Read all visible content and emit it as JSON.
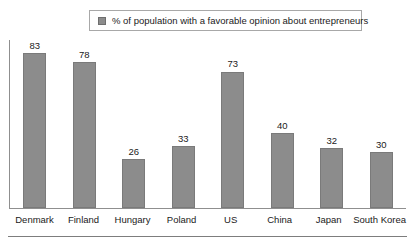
{
  "legend": {
    "swatch_icon": "legend-swatch-icon",
    "label": "% of population with a favorable opinion about entrepreneurs",
    "position": "top-center"
  },
  "colors": {
    "bar_fill": "#8c8c8c",
    "bar_border": "#7a7a7a",
    "axis": "#8f8f8f",
    "text": "#1a1a1a",
    "background": "#ffffff",
    "legend_border": "#a8a8a8"
  },
  "chart_data": {
    "type": "bar",
    "title": "",
    "subtitle": "",
    "xlabel": "",
    "ylabel": "",
    "ylim": [
      0,
      90
    ],
    "grid": false,
    "legend_position": "top-center",
    "categories": [
      "Denmark",
      "Finland",
      "Hungary",
      "Poland",
      "US",
      "China",
      "Japan",
      "South Korea"
    ],
    "values": [
      83,
      78,
      26,
      33,
      73,
      40,
      32,
      30
    ],
    "series": [
      {
        "name": "% of population with a favorable opinion about entrepreneurs",
        "values": [
          83,
          78,
          26,
          33,
          73,
          40,
          32,
          30
        ]
      }
    ],
    "bars": [
      {
        "category": "Denmark",
        "value": 83,
        "label": "83"
      },
      {
        "category": "Finland",
        "value": 78,
        "label": "78"
      },
      {
        "category": "Hungary",
        "value": 26,
        "label": "26"
      },
      {
        "category": "Poland",
        "value": 33,
        "label": "33"
      },
      {
        "category": "US",
        "value": 73,
        "label": "73"
      },
      {
        "category": "China",
        "value": 40,
        "label": "40"
      },
      {
        "category": "Japan",
        "value": 32,
        "label": "32"
      },
      {
        "category": "South Korea",
        "value": 30,
        "label": "30"
      }
    ],
    "tick_labels": [
      "Denmark",
      "Finland",
      "Hungary",
      "Poland",
      "US",
      "China",
      "Japan",
      "South Korea"
    ],
    "annotations": []
  }
}
